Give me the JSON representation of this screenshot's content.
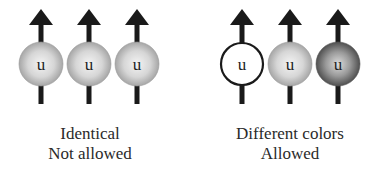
{
  "groups": [
    {
      "id": "identical",
      "caption_line1": "Identical",
      "caption_line2": "Not allowed",
      "quarks": [
        {
          "label": "u",
          "fill": "gray",
          "cx": 41
        },
        {
          "label": "u",
          "fill": "gray",
          "cx": 89
        },
        {
          "label": "u",
          "fill": "gray",
          "cx": 137
        }
      ]
    },
    {
      "id": "different-colors",
      "caption_line1": "Different colors",
      "caption_line2": "Allowed",
      "quarks": [
        {
          "label": "u",
          "fill": "white",
          "cx": 242
        },
        {
          "label": "u",
          "fill": "gray",
          "cx": 290
        },
        {
          "label": "u",
          "fill": "dark",
          "cx": 338
        }
      ]
    }
  ],
  "colors": {
    "arrow": "#1a1a1a",
    "ball_light_center": "#f2f2f2",
    "ball_light_edge": "#a8a8a8",
    "ball_dark_center": "#d8d8d8",
    "ball_dark_edge": "#555555",
    "white_ball_stroke": "#1a1a1a"
  }
}
